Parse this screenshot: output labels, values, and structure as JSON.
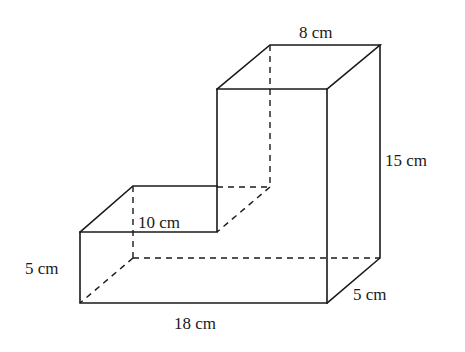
{
  "figure": {
    "type": "L-shaped prism (composite of two cuboids)",
    "labels": {
      "top_width": "8 cm",
      "right_height": "15 cm",
      "step_length": "10 cm",
      "left_height": "5 cm",
      "bottom_length": "18 cm",
      "depth": "5 cm"
    },
    "colors": {
      "line": "#1a1a1a",
      "background": "#ffffff"
    }
  }
}
